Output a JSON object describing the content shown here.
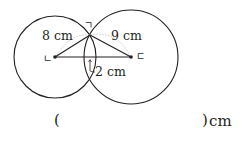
{
  "diagram": {
    "type": "two-intersecting-circles",
    "colors": {
      "stroke": "#231f20",
      "guide": "#b9b9b9",
      "background": "#ffffff"
    },
    "circles": [
      {
        "name": "left-circle",
        "cx": 55,
        "cy": 57,
        "r": 41
      },
      {
        "name": "right-circle",
        "cx": 131,
        "cy": 57,
        "r": 47
      }
    ],
    "points": {
      "top_intersection": {
        "label": "ㄱ",
        "x": 90,
        "y": 35
      },
      "left_center": {
        "label": "ㄴ",
        "x": 55,
        "y": 57
      },
      "right_center": {
        "label": "ㄷ",
        "x": 131,
        "y": 57
      }
    },
    "labels": {
      "left_radius": "8 cm",
      "right_radius": "9 cm",
      "overlap": "2 cm"
    }
  },
  "answer": {
    "open_paren": "(",
    "close_paren": ")",
    "unit": "cm",
    "value": ""
  }
}
